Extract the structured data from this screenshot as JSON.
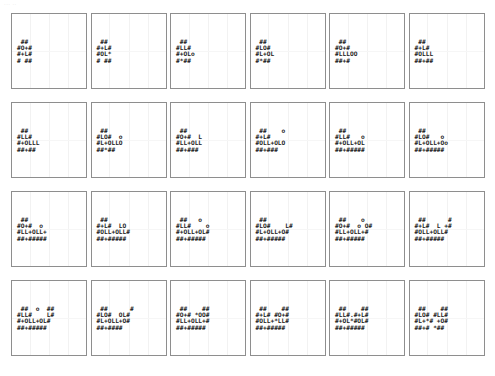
{
  "corner_label": "··· ··",
  "grid": {
    "rows": 4,
    "columns": 6,
    "panel_count": 24
  },
  "style": {
    "panel_border_color": "#8e8e8e",
    "gridline_color": "#f2f2f2",
    "glyph_color": "#1a1a1a",
    "background_color": "#ffffff"
  },
  "panels": [
    {
      "id": "panel-1",
      "row": 1,
      "col": 1,
      "art": " ## \n#O+#\n#+L#\n# ##"
    },
    {
      "id": "panel-2",
      "row": 1,
      "col": 2,
      "art": " ## \n#+L#\n#OL*\n# ##"
    },
    {
      "id": "panel-3",
      "row": 1,
      "col": 3,
      "art": " ## \n#LL#\n#+OLo\n#*##"
    },
    {
      "id": "panel-4",
      "row": 1,
      "col": 4,
      "art": " ## \n#LO#\n#L+OL\n#*##"
    },
    {
      "id": "panel-5",
      "row": 1,
      "col": 5,
      "art": " ## \n#O+#\n#LLLOO\n##+#"
    },
    {
      "id": "panel-6",
      "row": 1,
      "col": 6,
      "art": " ## \n#+L#\n#OLLL\n##+##"
    },
    {
      "id": "panel-7",
      "row": 2,
      "col": 1,
      "art": " ## \n#LL#\n#+OLLL\n##+##"
    },
    {
      "id": "panel-8",
      "row": 2,
      "col": 2,
      "art": " ## \n#LO#  o\n#L+OLLO\n##*##"
    },
    {
      "id": "panel-9",
      "row": 2,
      "col": 3,
      "art": " ## \n#O+#  L\n#LL+OLL\n##+###"
    },
    {
      "id": "panel-10",
      "row": 2,
      "col": 4,
      "art": " ##    o\n#+L#\n#OLL+OLO\n##+###"
    },
    {
      "id": "panel-11",
      "row": 2,
      "col": 5,
      "art": " ## \n#LL#   o\n#+OLL+OL\n##+#####"
    },
    {
      "id": "panel-12",
      "row": 2,
      "col": 6,
      "art": " ## \n#LO#   o\n#L+OLL+Oo\n##+#####"
    },
    {
      "id": "panel-13",
      "row": 3,
      "col": 1,
      "art": " ## \n#O+#  o\n#LL+OLL+\n##+#####"
    },
    {
      "id": "panel-14",
      "row": 3,
      "col": 2,
      "art": " ## \n#+L#  LO\n#OLL+OLL#\n##+#####"
    },
    {
      "id": "panel-15",
      "row": 3,
      "col": 3,
      "art": " ##   o\n#LL#    o\n#+OLL+OL#\n##+#####"
    },
    {
      "id": "panel-16",
      "row": 3,
      "col": 4,
      "art": " ## \n#LO#    L#\n#L+OLL+O#\n##+#####"
    },
    {
      "id": "panel-17",
      "row": 3,
      "col": 5,
      "art": " ##    o\n#O+#  o O#\n#LL+OLL+#\n##+#####"
    },
    {
      "id": "panel-18",
      "row": 3,
      "col": 6,
      "art": " ##      #\n#+L#  L +#\n#OLL+OLL#\n##+#####"
    },
    {
      "id": "panel-19",
      "row": 4,
      "col": 1,
      "art": " ##  o  ##\n#LL#    L#\n#+OLL+OL#\n##+#####"
    },
    {
      "id": "panel-20",
      "row": 4,
      "col": 2,
      "art": " ##      #\n#LO#  OL#\n#L+OLL+O#\n##+####"
    },
    {
      "id": "panel-21",
      "row": 4,
      "col": 3,
      "art": " ##    ##\n#O+# *OO#\n#LL+OLL+#\n##+#####"
    },
    {
      "id": "panel-22",
      "row": 4,
      "col": 4,
      "art": " ##    ##\n#+L# #O+#\n#OLL+*LL#\n##+#####"
    },
    {
      "id": "panel-23",
      "row": 4,
      "col": 5,
      "art": " ##    ##\n#LL#.#+L#\n#+OL*#OL#\n##+#####"
    },
    {
      "id": "panel-24",
      "row": 4,
      "col": 6,
      "art": " ##    ##\n#LO# #LL#\n#L+*# +O#\n##+# *##"
    }
  ]
}
